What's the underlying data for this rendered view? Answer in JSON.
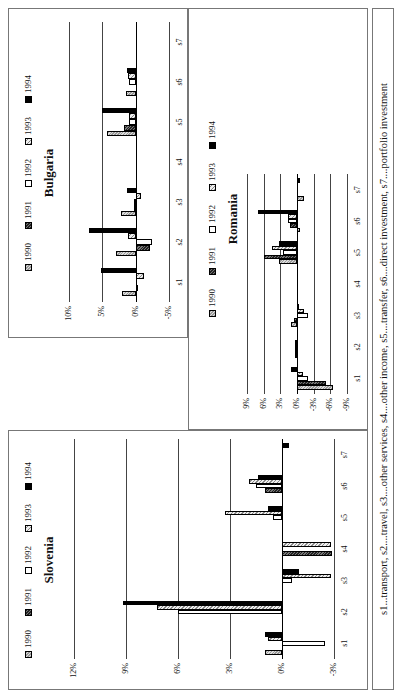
{
  "legend": {
    "years": [
      "1990",
      "1991",
      "1992",
      "1993",
      "1994"
    ]
  },
  "footnote": "s1...transport, s2....travel, s3....other services, s4....other income, s5....transfer, s6....direct investment, s7....portfolio investment",
  "chart_data": [
    {
      "type": "bar",
      "title": "Slovenia",
      "categories": [
        "s1",
        "s2",
        "s3",
        "s4",
        "s5",
        "s6",
        "s7"
      ],
      "ylim": [
        -3,
        12
      ],
      "yticks": [
        "-3%",
        "0%",
        "3%",
        "6%",
        "9%",
        "12%"
      ],
      "series": [
        {
          "name": "1990",
          "values": [
            1.0,
            0,
            0,
            0,
            0,
            0,
            0
          ]
        },
        {
          "name": "1991",
          "values": [
            0,
            0,
            0,
            -2.9,
            0,
            1.0,
            0
          ]
        },
        {
          "name": "1992",
          "values": [
            -2.5,
            6.0,
            -0.6,
            0,
            0.5,
            1.5,
            0
          ]
        },
        {
          "name": "1993",
          "values": [
            0.8,
            7.2,
            -2.8,
            -2.8,
            3.3,
            1.9,
            0
          ]
        },
        {
          "name": "1994",
          "values": [
            1.0,
            9.2,
            -1.0,
            0,
            0.8,
            1.4,
            -0.4
          ]
        }
      ],
      "legend_position": "top"
    },
    {
      "type": "bar",
      "title": "Bulgaria",
      "categories": [
        "s1",
        "s2",
        "s3",
        "s4",
        "s5",
        "s6",
        "s7"
      ],
      "ylim": [
        -5,
        10
      ],
      "yticks": [
        "-5%",
        "0%",
        "5%",
        "10%"
      ],
      "series": [
        {
          "name": "1990",
          "values": [
            2.0,
            3.0,
            2.2,
            0,
            4.3,
            1.4,
            0
          ]
        },
        {
          "name": "1991",
          "values": [
            -0.4,
            -2.2,
            0.2,
            0,
            1.8,
            0,
            0
          ]
        },
        {
          "name": "1992",
          "values": [
            0,
            -2.5,
            0.2,
            0,
            1.0,
            1.0,
            0
          ]
        },
        {
          "name": "1993",
          "values": [
            -1.3,
            1.2,
            -0.8,
            0,
            1.0,
            1.2,
            0
          ]
        },
        {
          "name": "1994",
          "values": [
            5.2,
            7.0,
            1.3,
            0,
            5.0,
            1.3,
            0
          ]
        }
      ],
      "legend_position": "top"
    },
    {
      "type": "bar",
      "title": "Romania",
      "categories": [
        "s1",
        "s2",
        "s3",
        "s4",
        "s5",
        "s6",
        "s7"
      ],
      "ylim": [
        -9,
        9
      ],
      "yticks": [
        "-9%",
        "-6%",
        "-3%",
        "0%",
        "3%",
        "6%",
        "9%"
      ],
      "series": [
        {
          "name": "1990",
          "values": [
            -6.5,
            0.4,
            1.0,
            0,
            3.2,
            -0.5,
            -1.2
          ]
        },
        {
          "name": "1991",
          "values": [
            -5.2,
            0.4,
            0.6,
            0,
            6.0,
            1.2,
            0
          ]
        },
        {
          "name": "1992",
          "values": [
            -2.0,
            0.3,
            -2.0,
            0,
            2.6,
            1.7,
            0
          ]
        },
        {
          "name": "1993",
          "values": [
            -1.0,
            0.3,
            -1.3,
            0,
            4.5,
            1.7,
            0
          ]
        },
        {
          "name": "1994",
          "values": [
            1.0,
            0,
            -0.3,
            0,
            3.3,
            7.0,
            -0.6
          ]
        }
      ],
      "legend_position": "top"
    }
  ]
}
